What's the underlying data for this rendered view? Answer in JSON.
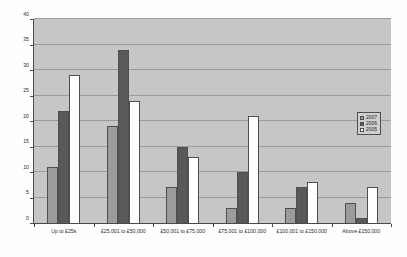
{
  "chart_data": {
    "type": "bar",
    "title": "",
    "xlabel": "",
    "ylabel": "",
    "ylim": [
      0,
      40
    ],
    "ytick_step": 5,
    "yticks": [
      "0",
      "5",
      "10",
      "15",
      "20",
      "25",
      "30",
      "35",
      "40"
    ],
    "grid": true,
    "legend_position": "right",
    "categories": [
      "Up to £25k",
      "£25,001 to £50,000",
      "£50,001 to £75,000",
      "£75,001 to £100,000",
      "£100,001 to £150,000",
      "Above £150,000"
    ],
    "series": [
      {
        "name": "2007",
        "color": "#9b9b9b",
        "values": [
          11,
          19,
          7,
          3,
          3,
          4
        ]
      },
      {
        "name": "2006",
        "color": "#595959",
        "values": [
          22,
          34,
          15,
          10,
          7,
          1
        ]
      },
      {
        "name": "2005",
        "color": "#ffffff",
        "values": [
          29,
          24,
          13,
          21,
          8,
          7
        ]
      }
    ]
  },
  "legend": {
    "entries": [
      {
        "label": "2007"
      },
      {
        "label": "2006"
      },
      {
        "label": "2005"
      }
    ]
  },
  "colors": {
    "plot_background": "#c6c6c6",
    "gridline": "#9a9a9a",
    "axis": "#4a4a4a",
    "series_2007": "#9b9b9b",
    "series_2006": "#595959",
    "series_2005": "#ffffff"
  }
}
